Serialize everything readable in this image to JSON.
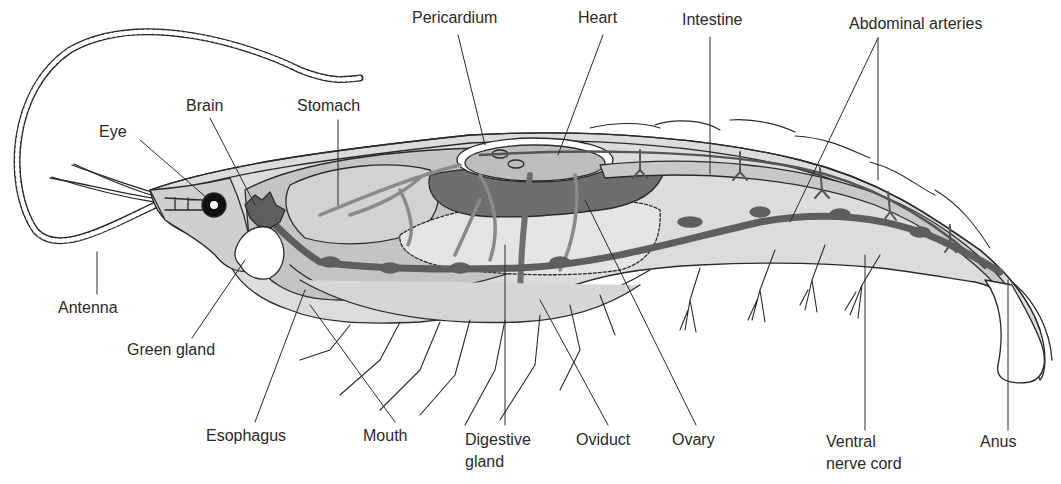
{
  "diagram": {
    "type": "anatomical-illustration",
    "colors": {
      "outline": "#2a2a2a",
      "light_fill": "#d8d8d8",
      "mid_fill": "#b5b5b5",
      "dark_fill": "#6e6e6e",
      "background": "#ffffff"
    },
    "labels": {
      "pericardium": "Pericardium",
      "heart": "Heart",
      "intestine": "Intestine",
      "abdominal_arteries": "Abdominal arteries",
      "brain": "Brain",
      "stomach": "Stomach",
      "eye": "Eye",
      "antenna": "Antenna",
      "green_gland": "Green gland",
      "esophagus": "Esophagus",
      "mouth": "Mouth",
      "digestive_gland_1": "Digestive",
      "digestive_gland_2": "gland",
      "oviduct": "Oviduct",
      "ovary": "Ovary",
      "ventral_nerve_cord_1": "Ventral",
      "ventral_nerve_cord_2": "nerve cord",
      "anus": "Anus"
    }
  }
}
